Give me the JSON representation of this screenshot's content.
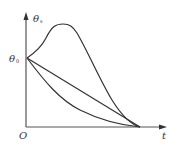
{
  "diagram": {
    "type": "line",
    "axes": {
      "y_label": "θ",
      "y_label_sub": "s",
      "x_label": "t",
      "origin_label": "O",
      "start_label": "θ",
      "start_label_sub": "0"
    },
    "curves": [
      {
        "name": "overshoot-curve",
        "description": "rises to a peak then falls to t axis"
      },
      {
        "name": "linear-curve",
        "description": "straight line decrease"
      },
      {
        "name": "concave-curve",
        "description": "fast initial decrease then flattening"
      }
    ],
    "colors": {
      "stroke": "#333333",
      "axis": "#555555"
    }
  }
}
